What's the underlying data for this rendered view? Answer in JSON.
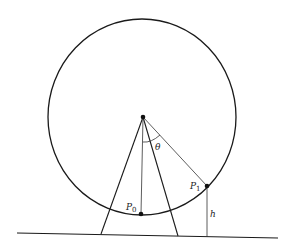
{
  "diagram": {
    "colors": {
      "stroke": "#1a1a1a",
      "thin_stroke": "#333333",
      "background": "#ffffff"
    },
    "wheel": {
      "cx": 142,
      "cy": 117,
      "rx": 94,
      "ry": 98
    },
    "ground": {
      "x1": 17,
      "y1": 233,
      "x2": 278,
      "y2": 238
    },
    "legs": [
      {
        "x1": 143,
        "y1": 117,
        "x2": 101,
        "y2": 234
      },
      {
        "x1": 143,
        "y1": 117,
        "x2": 178,
        "y2": 236
      }
    ],
    "points": {
      "center": {
        "x": 143,
        "y": 117
      },
      "P0": {
        "x": 141,
        "y": 214
      },
      "P1": {
        "x": 207,
        "y": 186
      }
    },
    "labels": {
      "p0_main": "P",
      "p0_sub": "0",
      "p1_main": "P",
      "p1_sub": "1",
      "theta": "θ",
      "h": "h"
    }
  }
}
